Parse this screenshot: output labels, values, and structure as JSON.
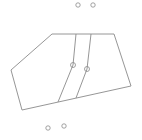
{
  "diagram": {
    "stroke_color": "#8a8a8a",
    "background": "#ffffff",
    "polygon": {
      "points": "52,34 114,34 131,86 22,110 11,70"
    },
    "inner_lines": [
      {
        "points": "76,34 73,65 58,102"
      },
      {
        "points": "91,34 87,69 76,98"
      }
    ],
    "circles": [
      {
        "cx": 78,
        "cy": 5,
        "r": 2.2,
        "label": "top-left-circle"
      },
      {
        "cx": 93,
        "cy": 5,
        "r": 2.2,
        "label": "top-right-circle"
      },
      {
        "cx": 73,
        "cy": 65,
        "r": 2.5,
        "label": "inner-left-circle"
      },
      {
        "cx": 87,
        "cy": 69,
        "r": 2.5,
        "label": "inner-right-circle"
      },
      {
        "cx": 48,
        "cy": 128,
        "r": 2.2,
        "label": "bottom-left-circle"
      },
      {
        "cx": 64,
        "cy": 126,
        "r": 2.2,
        "label": "bottom-right-circle"
      }
    ]
  }
}
